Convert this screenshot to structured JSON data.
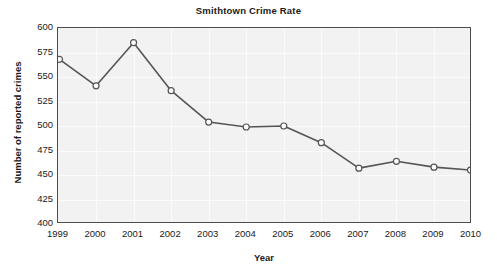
{
  "chart_data": {
    "type": "line",
    "title": "Smithtown Crime Rate",
    "xlabel": "Year",
    "ylabel": "Number of reported crimes",
    "categories": [
      "1999",
      "2000",
      "2001",
      "2002",
      "2003",
      "2004",
      "2005",
      "2006",
      "2007",
      "2008",
      "2009",
      "2010"
    ],
    "values": [
      568,
      541,
      585,
      536,
      504,
      499,
      500,
      483,
      457,
      464,
      458,
      455
    ],
    "series": [
      {
        "name": "Number of reported crimes",
        "values": [
          568,
          541,
          585,
          536,
          504,
          499,
          500,
          483,
          457,
          464,
          458,
          455
        ]
      }
    ],
    "ylim": [
      400,
      600
    ],
    "yticks": [
      400,
      425,
      450,
      475,
      500,
      525,
      550,
      575,
      600
    ],
    "ytick_labels": [
      "400",
      "425",
      "450",
      "475",
      "500",
      "525",
      "550",
      "575",
      "600"
    ],
    "xtick_labels": [
      "1999",
      "2000",
      "2001",
      "2002",
      "2003",
      "2004",
      "2005",
      "2006",
      "2007",
      "2008",
      "2009",
      "2010"
    ],
    "grid": true,
    "legend": "none",
    "line_color": "#555555",
    "marker_color": "#ffffff",
    "marker_edge_color": "#555555",
    "plot_background": "#f2f2f2",
    "frame_color": "#4d4d4d",
    "text_color": "#1a1a1a"
  }
}
